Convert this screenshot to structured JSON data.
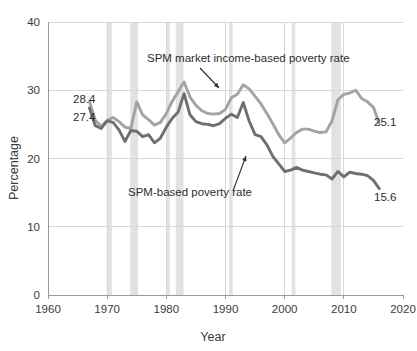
{
  "chart_data": {
    "type": "line",
    "title": "",
    "xlabel": "Year",
    "ylabel": "Percentage",
    "xlim": [
      1960,
      2020
    ],
    "ylim": [
      0,
      40
    ],
    "xticks": [
      1960,
      1970,
      1980,
      1990,
      2000,
      2010,
      2020
    ],
    "yticks": [
      0,
      10,
      20,
      30,
      40
    ],
    "grid": "horizontal-and-vertical",
    "legend_position": "inline-annotations",
    "series": [
      {
        "name": "SPM market income-based poverty rate",
        "color": "#a3a3a3",
        "start_label": "28.4",
        "end_label": "25.1",
        "x": [
          1967,
          1968,
          1969,
          1970,
          1971,
          1972,
          1973,
          1974,
          1975,
          1976,
          1977,
          1978,
          1979,
          1980,
          1981,
          1982,
          1983,
          1984,
          1985,
          1986,
          1987,
          1988,
          1989,
          1990,
          1991,
          1992,
          1993,
          1994,
          1995,
          1996,
          1997,
          1998,
          1999,
          2000,
          2001,
          2002,
          2003,
          2004,
          2005,
          2006,
          2007,
          2008,
          2009,
          2010,
          2011,
          2012,
          2013,
          2014,
          2015,
          2016
        ],
        "y": [
          28.4,
          25.6,
          24.7,
          25.6,
          26.0,
          25.4,
          24.6,
          24.4,
          28.3,
          26.4,
          25.7,
          24.9,
          25.3,
          26.6,
          28.4,
          29.8,
          31.2,
          29.0,
          27.8,
          27.0,
          26.6,
          26.5,
          26.6,
          27.2,
          28.9,
          29.4,
          30.8,
          30.2,
          29.1,
          28.0,
          26.6,
          25.1,
          23.5,
          22.3,
          23.0,
          23.8,
          24.3,
          24.3,
          24.0,
          23.8,
          23.9,
          25.5,
          28.6,
          29.4,
          29.6,
          30.0,
          28.8,
          28.3,
          27.5,
          25.1
        ]
      },
      {
        "name": "SPM-based poverty rate",
        "color": "#6f6f6f",
        "start_label": "27.4",
        "end_label": "15.6",
        "x": [
          1967,
          1968,
          1969,
          1970,
          1971,
          1972,
          1973,
          1974,
          1975,
          1976,
          1977,
          1978,
          1979,
          1980,
          1981,
          1982,
          1983,
          1984,
          1985,
          1986,
          1987,
          1988,
          1989,
          1990,
          1991,
          1992,
          1993,
          1994,
          1995,
          1996,
          1997,
          1998,
          1999,
          2000,
          2001,
          2002,
          2003,
          2004,
          2005,
          2006,
          2007,
          2008,
          2009,
          2010,
          2011,
          2012,
          2013,
          2014,
          2015,
          2016
        ],
        "y": [
          27.4,
          24.8,
          24.4,
          25.5,
          25.3,
          24.2,
          22.5,
          24.1,
          24.0,
          23.2,
          23.5,
          22.3,
          23.0,
          24.6,
          25.9,
          26.8,
          29.5,
          26.4,
          25.4,
          25.1,
          25.0,
          24.8,
          25.1,
          25.9,
          26.5,
          26.0,
          28.2,
          25.5,
          23.5,
          23.2,
          22.0,
          20.3,
          19.2,
          18.1,
          18.3,
          18.7,
          18.3,
          18.1,
          17.9,
          17.7,
          17.6,
          17.0,
          18.1,
          17.3,
          18.0,
          17.8,
          17.7,
          17.5,
          16.8,
          15.6
        ]
      }
    ],
    "recession_bands": [
      {
        "start": 1969.9,
        "end": 1970.8
      },
      {
        "start": 1973.9,
        "end": 1975.2
      },
      {
        "start": 1980.1,
        "end": 1980.6
      },
      {
        "start": 1981.6,
        "end": 1982.9
      },
      {
        "start": 1990.6,
        "end": 1991.2
      },
      {
        "start": 2001.2,
        "end": 2001.8
      },
      {
        "start": 2007.9,
        "end": 2009.5
      }
    ],
    "annotations": [
      {
        "text": "SPM market income-based poverty rate",
        "text_x": 147,
        "text_y": 62,
        "arrow_from_x": 200,
        "arrow_from_y": 68,
        "arrow_to_x": 219,
        "arrow_to_y": 88
      },
      {
        "text": "SPM-based poverty rate",
        "text_x": 128,
        "text_y": 196,
        "arrow_from_x": 233,
        "arrow_from_y": 191,
        "arrow_to_x": 246,
        "arrow_to_y": 156
      }
    ],
    "value_labels": [
      {
        "text": "28.4",
        "x": 73,
        "y": 103
      },
      {
        "text": "27.4",
        "x": 73,
        "y": 121
      },
      {
        "text": "25.1",
        "x": 374,
        "y": 126
      },
      {
        "text": "15.6",
        "x": 374,
        "y": 201
      }
    ]
  }
}
